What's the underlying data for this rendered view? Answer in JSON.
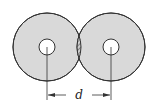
{
  "diagram": {
    "colors": {
      "disc_fill": "#d9d9d9",
      "stroke": "#333333",
      "hole_fill": "#ffffff",
      "hatch": "#555555"
    },
    "left_disc": {
      "cx": 47,
      "cy": 47,
      "r": 34,
      "hole_r": 8
    },
    "right_disc": {
      "cx": 111,
      "cy": 47,
      "r": 34,
      "hole_r": 8
    },
    "dimension": {
      "label": "d",
      "y": 95
    }
  }
}
